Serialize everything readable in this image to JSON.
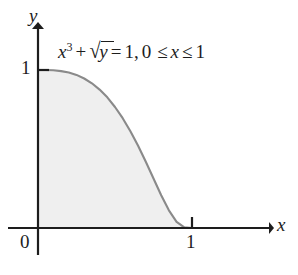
{
  "figure": {
    "background_color": "#ffffff",
    "axis_color": "#1d1d1d",
    "curve_color": "#8a8a8a",
    "fill_color": "#efefef"
  },
  "equation": {
    "full_text": "x^3 + √y = 1, 0 ≤ x ≤ 1",
    "base_var": "x",
    "exponent": "3",
    "plus": "+",
    "radical_sign": "√",
    "radical_arg": "y",
    "equals": "=",
    "rhs": "1,",
    "domain_lower": "0",
    "le_1": "≤",
    "domain_var": "x",
    "le_2": "≤",
    "domain_upper": "1"
  },
  "axes": {
    "x_label": "x",
    "y_label": "y",
    "origin_label": "0",
    "x_tick_label": "1",
    "y_tick_label": "1"
  },
  "chart_data": {
    "type": "line",
    "subtitle": "",
    "xlabel": "x",
    "ylabel": "y",
    "xlim": [
      0,
      1
    ],
    "ylim": [
      0,
      1
    ],
    "grid": false,
    "legend": false,
    "legend_position": "none",
    "shaded_region": {
      "label": "area under curve",
      "fill_color": "#efefef",
      "between": [
        "y = (1 - x^3)^2",
        "y = 0"
      ],
      "x_range": [
        0,
        1
      ]
    },
    "annotations": [
      {
        "text": "x^3 + √y = 1, 0 ≤ x ≤ 1",
        "x": 0.15,
        "y": 1.08
      }
    ],
    "xticks": [
      0,
      1
    ],
    "xticklabels": [
      "0",
      "1"
    ],
    "yticks": [
      1
    ],
    "yticklabels": [
      "1"
    ],
    "series": [
      {
        "name": "y = (1 - x^3)^2",
        "color": "#8a8a8a",
        "x": [
          0.0,
          0.05,
          0.1,
          0.15,
          0.2,
          0.25,
          0.3,
          0.35,
          0.4,
          0.45,
          0.5,
          0.55,
          0.6,
          0.65,
          0.7,
          0.75,
          0.8,
          0.85,
          0.9,
          0.95,
          1.0
        ],
        "values": [
          1.0,
          1.0,
          0.998,
          0.993,
          0.984,
          0.969,
          0.946,
          0.916,
          0.876,
          0.827,
          0.766,
          0.695,
          0.612,
          0.52,
          0.419,
          0.313,
          0.207,
          0.112,
          0.039,
          0.004,
          0.0
        ]
      }
    ]
  }
}
